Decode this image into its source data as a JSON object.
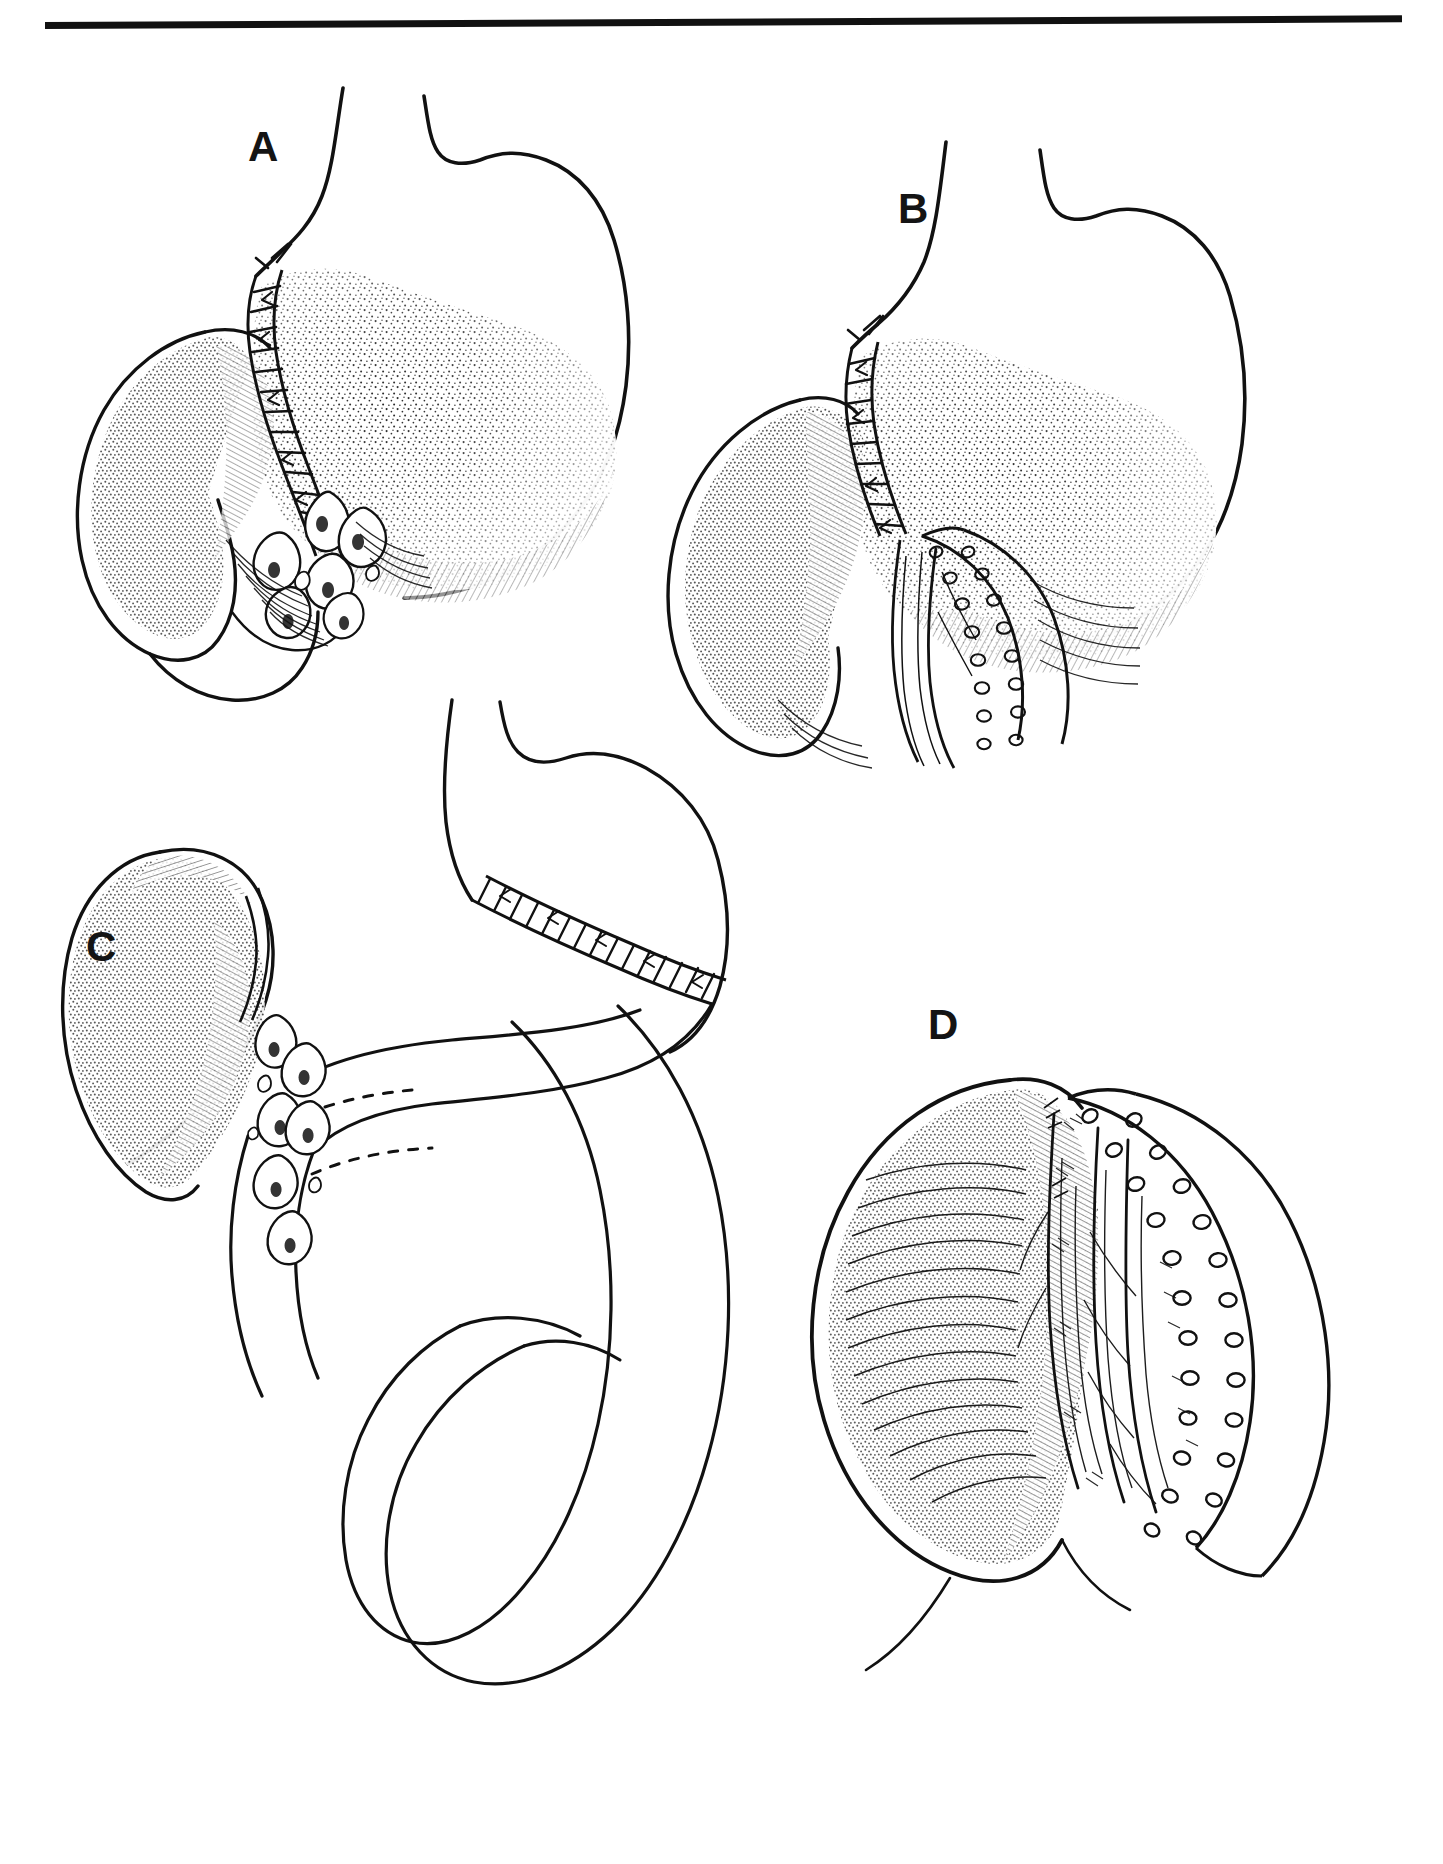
{
  "figure": {
    "medium": "pen-and-ink line drawing",
    "background_color": "#ffffff",
    "ink_color": "#111111",
    "top_rule": {
      "present": true,
      "color": "#111111",
      "x_start": 45,
      "x_end": 1402,
      "y": 25,
      "thickness": 7
    },
    "panels": [
      {
        "id": "A",
        "label": "A",
        "label_x": 248,
        "label_y": 126,
        "caption_text": "",
        "subject": "hand-sewn gastroduodenal anastomosis with interrupted sutures and leaking droplets",
        "features": [
          "stomach body with stippled shading",
          "duodenal bulb with stippled shading",
          "interrupted suture line across anastomosis",
          "suture knots with tails",
          "teardrop droplets below anastomosis",
          "mucosal rugae hatching"
        ]
      },
      {
        "id": "B",
        "label": "B",
        "label_x": 898,
        "label_y": 188,
        "caption_text": "",
        "subject": "stapled gastroduodenal anastomosis with double staple row",
        "features": [
          "stomach body with stippled shading",
          "duodenal bulb with stippled shading",
          "interrupted suture line on lesser curve",
          "double-row circular staple line",
          "everted mucosal folds",
          "mucosal rugae hatching"
        ]
      },
      {
        "id": "C",
        "label": "C",
        "label_x": 86,
        "label_y": 926,
        "caption_text": "",
        "subject": "duodenal stump with leaking droplets and Roux-en-Y jejunal loop",
        "features": [
          "duodenal stump with stippled shading",
          "teardrop droplets",
          "gastric remnant with stapled closure line",
          "jejunal limb loop crossing behind",
          "dashed hidden contour lines"
        ]
      },
      {
        "id": "D",
        "label": "D",
        "label_x": 928,
        "label_y": 1004,
        "caption_text": "",
        "subject": "close-up of stapled anastomosis showing staple row and mucosal folds",
        "features": [
          "duodenal bulb with stippled and hatched shading",
          "double-row circular staple line",
          "everted mucosal folds",
          "fine hair-line villous detail"
        ]
      }
    ],
    "icons": {
      "droplet": "teardrop-icon",
      "staple": "staple-circle-icon",
      "suture": "suture-stitch-icon"
    }
  }
}
